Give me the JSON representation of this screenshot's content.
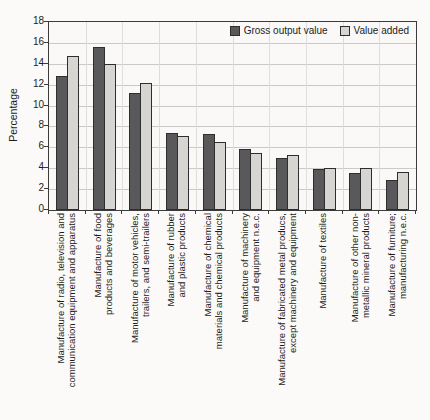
{
  "chart_data": {
    "type": "bar",
    "title": "",
    "ylabel": "Percentage",
    "ylim": [
      0,
      18
    ],
    "yticks": [
      0,
      2,
      4,
      6,
      8,
      10,
      12,
      14,
      16,
      18
    ],
    "grid": true,
    "legend_position": "top-right-inside",
    "bar_colors": {
      "gross_output_value": "#59595b",
      "value_added": "#d6d5d2"
    },
    "categories": [
      {
        "name": "Manufacture of radio, television and communication equipment and apparatus",
        "lines": [
          "Manufacture of radio, television and",
          "communication equipment and apparatus"
        ]
      },
      {
        "name": "Manufacture of food products and beverages",
        "lines": [
          "Manufacture of food",
          "products and beverages"
        ]
      },
      {
        "name": "Manufacture of motor vehicles, trailers, and semi-trailers",
        "lines": [
          "Manufacture of motor vehicles,",
          "trailers, and semi-trailers"
        ]
      },
      {
        "name": "Manufacture of rubber and plastic products",
        "lines": [
          "Manufacture of rubber",
          "and plastic products"
        ]
      },
      {
        "name": "Manufacture of chemical materials and chemical products",
        "lines": [
          "Manufacture of chemical",
          "materials and chemical products"
        ]
      },
      {
        "name": "Manufacture of machinery and equipment n.e.c.",
        "lines": [
          "Manufacture of machinery",
          "and equipment n.e.c."
        ]
      },
      {
        "name": "Manufacture of fabricated metal producs, except machinery and equipment",
        "lines": [
          "Manufacture of fabricated metal producs,",
          "except machinery and equipment"
        ]
      },
      {
        "name": "Manufacture of textiles",
        "lines": [
          "Manufacture of textiles"
        ]
      },
      {
        "name": "Manufacture of other non-metallic mineral products",
        "lines": [
          "Manufacture of other non-",
          "metallic mineral products"
        ]
      },
      {
        "name": "Manufacture of furniture; manufacturing n.e.c.",
        "lines": [
          "Manufacture of furniture;",
          "manufacturing n.e.c."
        ]
      }
    ],
    "series": [
      {
        "name": "Gross output value",
        "color": "#59595b",
        "border": "#2e2e2e",
        "values": [
          12.8,
          15.6,
          11.2,
          7.4,
          7.3,
          5.8,
          5.0,
          3.9,
          3.5,
          2.9
        ]
      },
      {
        "name": "Value added",
        "color": "#d6d5d2",
        "border": "#2e2e2e",
        "values": [
          14.7,
          14.0,
          12.2,
          7.1,
          6.5,
          5.5,
          5.3,
          4.0,
          4.0,
          3.6
        ]
      }
    ]
  }
}
